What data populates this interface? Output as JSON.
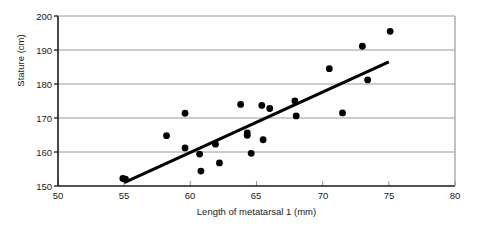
{
  "chart_data": {
    "type": "scatter",
    "title": "",
    "xlabel": "Length of metatarsal 1 (mm)",
    "ylabel": "Stature (cm)",
    "xlim": [
      50,
      80
    ],
    "ylim": [
      150,
      200
    ],
    "xticks": [
      "50",
      "55",
      "60",
      "65",
      "70",
      "75",
      "80"
    ],
    "yticks": [
      "150",
      "160",
      "170",
      "180",
      "190",
      "200"
    ],
    "grid": "horizontal",
    "legend": "none",
    "marker_color": "#000000",
    "grid_color": "#9a9a9a",
    "axis_color": "#1a1a1a",
    "points": [
      {
        "x": 54.9,
        "y": 152.2
      },
      {
        "x": 55.1,
        "y": 152.0
      },
      {
        "x": 58.2,
        "y": 164.8
      },
      {
        "x": 59.6,
        "y": 171.4
      },
      {
        "x": 59.6,
        "y": 161.2
      },
      {
        "x": 60.7,
        "y": 159.4
      },
      {
        "x": 60.8,
        "y": 154.4
      },
      {
        "x": 61.9,
        "y": 162.3
      },
      {
        "x": 62.2,
        "y": 156.8
      },
      {
        "x": 63.8,
        "y": 174.0
      },
      {
        "x": 64.3,
        "y": 165.6
      },
      {
        "x": 64.3,
        "y": 164.9
      },
      {
        "x": 64.6,
        "y": 159.6
      },
      {
        "x": 65.4,
        "y": 173.7
      },
      {
        "x": 65.5,
        "y": 163.6
      },
      {
        "x": 66.0,
        "y": 172.8
      },
      {
        "x": 67.9,
        "y": 175.0
      },
      {
        "x": 68.0,
        "y": 170.6
      },
      {
        "x": 70.5,
        "y": 184.5
      },
      {
        "x": 71.5,
        "y": 171.5
      },
      {
        "x": 73.0,
        "y": 191.1
      },
      {
        "x": 73.4,
        "y": 181.2
      },
      {
        "x": 75.1,
        "y": 195.5
      }
    ],
    "fit_line": {
      "x0": 55.0,
      "y0": 151.0,
      "x1": 75.0,
      "y1": 186.5
    }
  }
}
